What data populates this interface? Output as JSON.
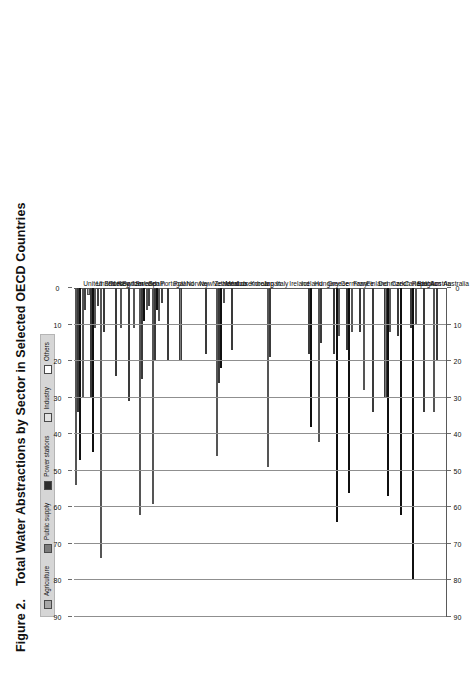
{
  "figure": {
    "number": "Figure 2.",
    "title": "Total Water Abstractions by Sector in Selected OECD Countries"
  },
  "legend": {
    "items": [
      {
        "label": "Agriculture",
        "color": "#a8a8a8"
      },
      {
        "label": "Public supply",
        "color": "#7c7c7c"
      },
      {
        "label": "Power stations",
        "color": "#2e2e2e"
      },
      {
        "label": "Industry",
        "color": "#e2e2e2"
      },
      {
        "label": "Others",
        "color": "#ffffff"
      }
    ]
  },
  "axis": {
    "ticks": [
      "0",
      "10",
      "20",
      "30",
      "40",
      "50",
      "60",
      "70",
      "80",
      "90"
    ],
    "min": 0,
    "max": 90
  },
  "chart_data": {
    "type": "bar",
    "orientation": "horizontal",
    "title": "Total Water Abstractions by Sector in Selected OECD Countries",
    "xlabel": "",
    "ylabel": "",
    "xlim": [
      0,
      90
    ],
    "grid": true,
    "legend_position": "top",
    "categories": [
      "United States",
      "United Kingdom",
      "Turkey",
      "Switzerland",
      "Sweden",
      "Spain",
      "Portugal",
      "Poland",
      "Norway",
      "New Zealand",
      "Netherlands",
      "Mexico",
      "Luxembourg",
      "Korea",
      "Japan",
      "Italy",
      "Ireland",
      "Iceland",
      "Hungary",
      "Greece",
      "Germany",
      "France",
      "Finland",
      "Denmark",
      "Czech Republic",
      "Canada",
      "Belgium",
      "Austria",
      "Australia"
    ],
    "series": [
      {
        "name": "Agriculture",
        "values": [
          54,
          2,
          74,
          0,
          0,
          62,
          59,
          0,
          0,
          0,
          0,
          46,
          0,
          0,
          0,
          49,
          0,
          0,
          0,
          42,
          0,
          0,
          0,
          0,
          0,
          0,
          0,
          0,
          34
        ]
      },
      {
        "name": "Public supply",
        "values": [
          34,
          30,
          12,
          24,
          31,
          25,
          20,
          20,
          20,
          0,
          18,
          26,
          17,
          0,
          0,
          19,
          0,
          0,
          18,
          15,
          18,
          17,
          12,
          34,
          30,
          13,
          11,
          34,
          20
        ]
      },
      {
        "name": "Power stations",
        "values": [
          47,
          45,
          0,
          0,
          0,
          9,
          6,
          0,
          0,
          0,
          0,
          22,
          0,
          0,
          0,
          0,
          0,
          0,
          38,
          0,
          64,
          56,
          0,
          0,
          57,
          62,
          80,
          0,
          0
        ]
      },
      {
        "name": "Industry",
        "values": [
          30,
          11,
          0,
          11,
          11,
          6,
          9,
          0,
          0,
          0,
          0,
          4,
          0,
          0,
          0,
          0,
          0,
          0,
          0,
          0,
          13,
          12,
          28,
          0,
          12,
          0,
          10,
          0,
          0
        ]
      },
      {
        "name": "Others",
        "values": [
          6,
          5,
          0,
          0,
          0,
          5,
          4,
          0,
          0,
          0,
          0,
          0,
          0,
          0,
          0,
          0,
          0,
          0,
          0,
          0,
          0,
          0,
          0,
          0,
          0,
          0,
          0,
          0,
          0
        ]
      }
    ]
  },
  "country_labels": [
    "United States",
    "United Kingdom",
    "Turkey",
    "Switzerland",
    "Sweden",
    "Spain",
    "Portugal",
    "Poland",
    "Norway",
    "New Zealand",
    "Netherlands",
    "Mexico",
    "Luxembourg",
    "Korea",
    "Japan",
    "Italy",
    "Ireland",
    "Iceland",
    "Hungary",
    "Greece",
    "Germany",
    "France",
    "Finland",
    "Denmark",
    "Czech Republic",
    "Canada",
    "Belgium",
    "Austria",
    "Australia"
  ]
}
